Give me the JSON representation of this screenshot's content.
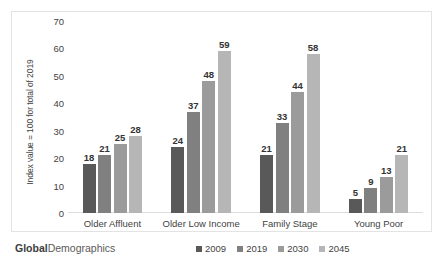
{
  "chart_data": {
    "type": "bar",
    "title": "",
    "subtitle": "",
    "xlabel": "",
    "ylabel": "Index value = 100 for total of 2019",
    "ylim": [
      0,
      70
    ],
    "ytick_step": 10,
    "yticks": [
      "0",
      "10",
      "20",
      "30",
      "40",
      "50",
      "60",
      "70"
    ],
    "grid": false,
    "legend_position": "bottom-right",
    "categories": [
      "Older Affluent",
      "Older Low Income",
      "Family Stage",
      "Young Poor"
    ],
    "series": [
      {
        "name": "2009",
        "color": "#595959",
        "values": [
          18,
          24,
          21,
          5
        ]
      },
      {
        "name": "2019",
        "color": "#808080",
        "values": [
          21,
          37,
          33,
          9
        ]
      },
      {
        "name": "2030",
        "color": "#9b9b9b",
        "values": [
          25,
          48,
          44,
          13
        ]
      },
      {
        "name": "2045",
        "color": "#b6b6b6",
        "values": [
          28,
          59,
          58,
          21
        ]
      }
    ]
  },
  "footer": {
    "brand_bold": "Global",
    "brand_rest": "Demographics"
  },
  "colors": {
    "frame_border": "#e3e3e3",
    "axis_line": "#dddddd",
    "text": "#3f3f3f",
    "label_text": "#333333"
  }
}
